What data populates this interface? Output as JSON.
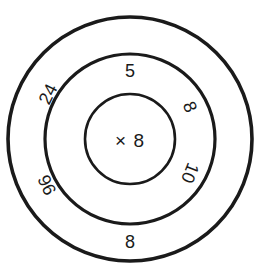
{
  "diagram": {
    "type": "multiplication-wheel",
    "geometry": {
      "width": 259,
      "height": 278,
      "center_x": 130,
      "center_y": 139,
      "inner_radius": 45,
      "middle_radius": 85,
      "outer_radius": 122,
      "ring_stroke_width": 3.4,
      "divider_angles_deg": [
        0,
        45,
        135,
        180,
        225,
        315
      ]
    },
    "colors": {
      "background": "#ffffff",
      "ring_stroke": "#1a1a1a",
      "divider_stroke": "#6e6e6e",
      "text": "#1a1a1a"
    },
    "center": {
      "label": "× 8",
      "operator": "×",
      "multiplier": "8"
    },
    "middle_ring": {
      "name": "factors-ring",
      "segments": [
        {
          "id": "mid-top",
          "label": "5",
          "angle_deg": 90,
          "rotation_deg": 0
        },
        {
          "id": "mid-upper-right",
          "label": "8",
          "angle_deg": 22.5,
          "rotation_deg": 68
        },
        {
          "id": "mid-lower-right",
          "label": "10",
          "angle_deg": -22.5,
          "rotation_deg": 112
        },
        {
          "id": "mid-bottom",
          "label": "",
          "angle_deg": 270,
          "rotation_deg": 0
        },
        {
          "id": "mid-lower-left",
          "label": "",
          "angle_deg": 202.5,
          "rotation_deg": 0
        },
        {
          "id": "mid-upper-left",
          "label": "",
          "angle_deg": 157.5,
          "rotation_deg": 0
        }
      ]
    },
    "outer_ring": {
      "name": "products-ring",
      "segments": [
        {
          "id": "outer-upper-left",
          "label": "24",
          "angle_deg": 157.5,
          "rotation_deg": -64
        },
        {
          "id": "outer-lower-left",
          "label": "96",
          "angle_deg": 202.5,
          "rotation_deg": -115
        },
        {
          "id": "outer-bottom",
          "label": "8",
          "angle_deg": 270,
          "rotation_deg": 0
        },
        {
          "id": "outer-top",
          "label": "",
          "angle_deg": 90,
          "rotation_deg": 0
        },
        {
          "id": "outer-upper-right",
          "label": "",
          "angle_deg": 22.5,
          "rotation_deg": 0
        },
        {
          "id": "outer-lower-right",
          "label": "",
          "angle_deg": -22.5,
          "rotation_deg": 0
        }
      ]
    }
  }
}
